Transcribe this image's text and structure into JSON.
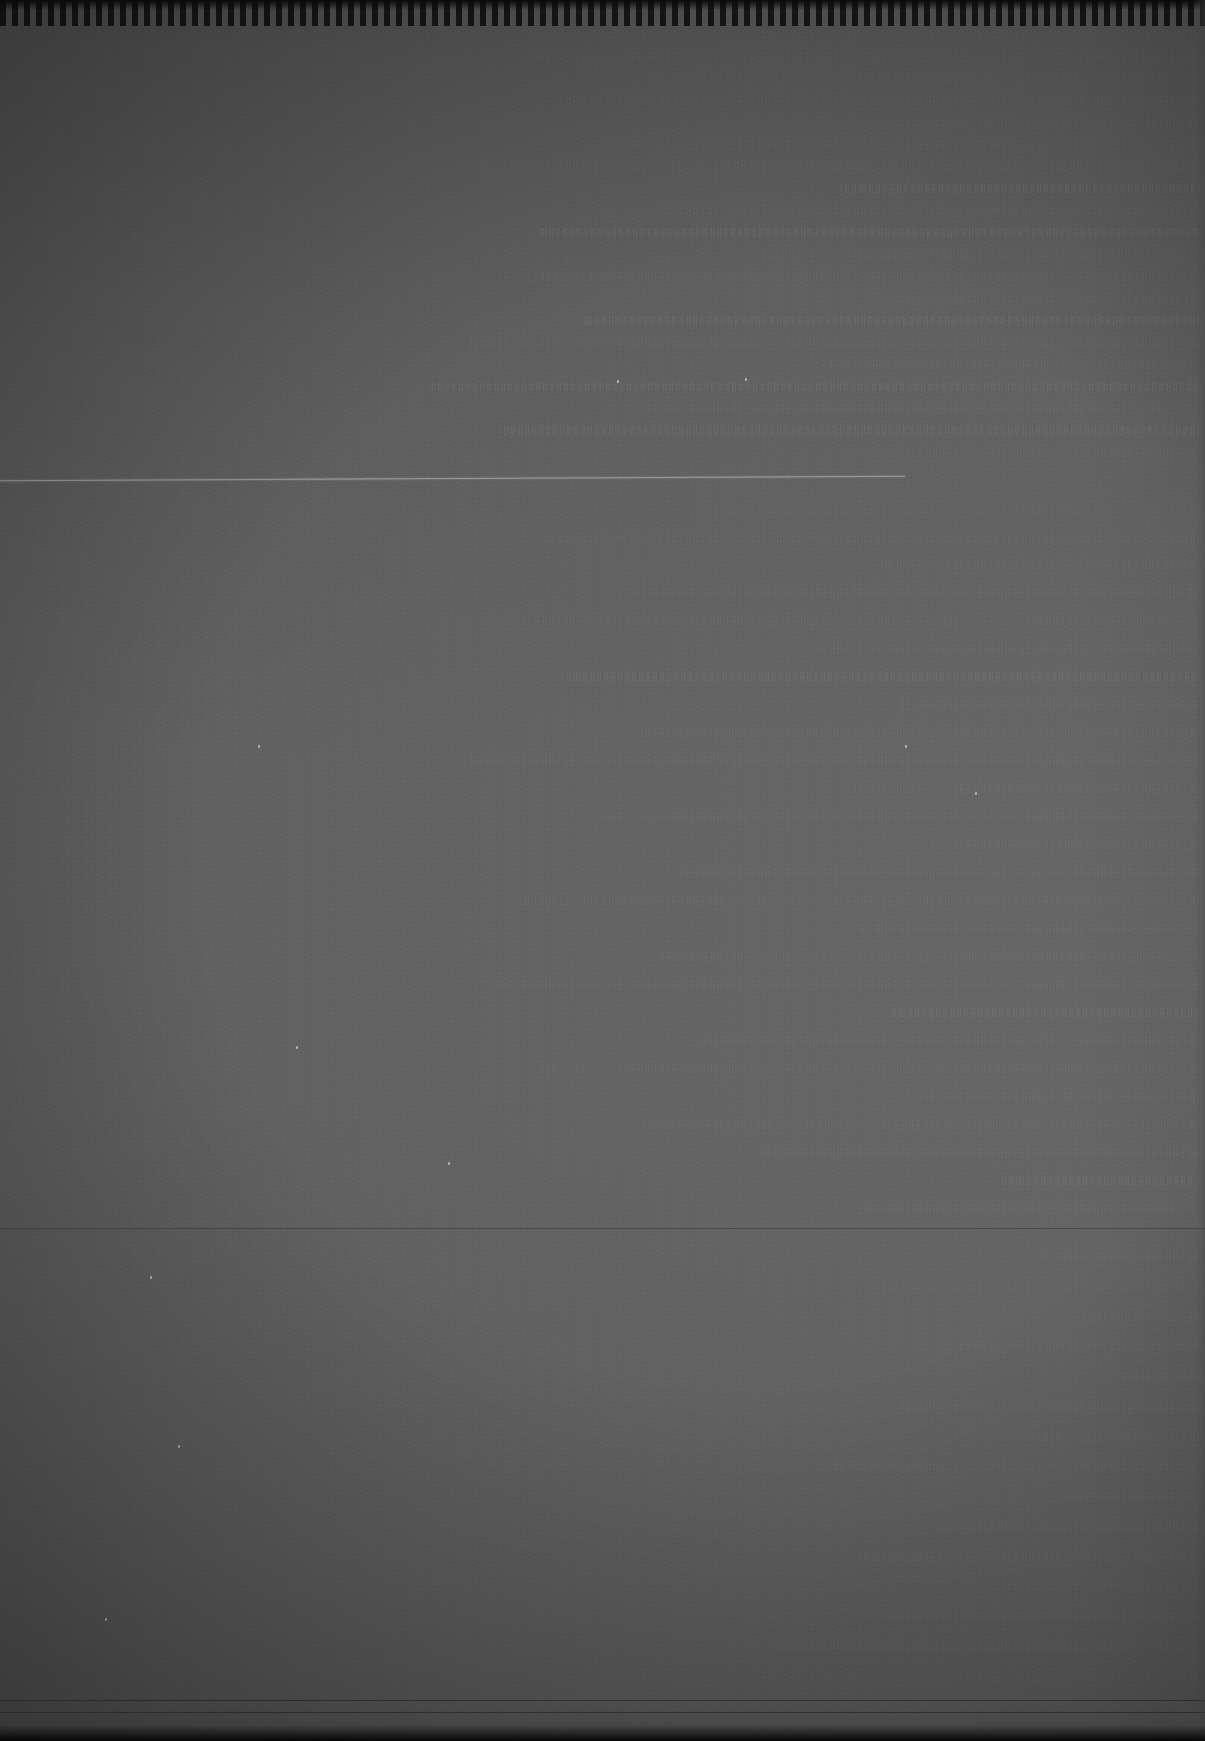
{
  "document": {
    "kind": "underexposed-scanned-page",
    "orientation": "portrait",
    "width_px": 1205,
    "height_px": 1741,
    "legibility_note": "No text is legible at any zoom level; the page is almost entirely black with faint line structure.",
    "alt_text": "A very dark, near-black photograph of a printed page. Faint horizontal rows of unreadable text are visible toward the right half, with a thin bright horizontal rule across the upper-middle area and fainter rules lower down."
  },
  "colors": {
    "page_background": "#242424",
    "darkest_area": "#141414",
    "lightest_area": "#2c2c2c",
    "rule_bright": "#9a9a9a",
    "rule_faint": "#4a4a4a",
    "edge_shadow": "#090909",
    "page_edge_highlight": "#484848"
  },
  "regions": {
    "top_edge": {
      "label": "wavy dark page edge",
      "y": 0,
      "height": 26
    },
    "left_margin": {
      "label": "blank left margin",
      "x": 0,
      "width": 400
    },
    "text_column": {
      "label": "faint unreadable text block",
      "x": 410,
      "width": 790
    },
    "right_page_edge": {
      "label": "lighter page edge strip",
      "x": 1193,
      "width": 12
    },
    "bottom_edge": {
      "label": "dark bottom page edge",
      "y": 1725,
      "height": 16
    }
  },
  "rules": [
    {
      "name": "primary-separator-rule",
      "x": 0,
      "y": 478,
      "width": 905,
      "weight": "bright"
    },
    {
      "name": "secondary-separator-rule",
      "x": 0,
      "y": 1228,
      "width": 1205,
      "weight": "faint"
    },
    {
      "name": "lower-separator-rule",
      "x": 0,
      "y": 1700,
      "width": 1205,
      "weight": "very-faint"
    },
    {
      "name": "lower-separator-rule-2",
      "x": 0,
      "y": 1712,
      "width": 1205,
      "weight": "very-faint"
    }
  ],
  "text_lines": [
    {
      "x": 600,
      "y": 30,
      "w": 600,
      "o": "dimmer"
    },
    {
      "x": 520,
      "y": 52,
      "w": 680,
      "o": "dim"
    },
    {
      "x": 700,
      "y": 74,
      "w": 500,
      "o": "dim"
    },
    {
      "x": 560,
      "y": 96,
      "w": 640,
      "o": "dim"
    },
    {
      "x": 880,
      "y": 118,
      "w": 320,
      "o": "dim"
    },
    {
      "x": 620,
      "y": 140,
      "w": 580,
      "o": "dim"
    },
    {
      "x": 480,
      "y": 162,
      "w": 720,
      "o": "dim"
    },
    {
      "x": 840,
      "y": 184,
      "w": 360,
      "o": "normal"
    },
    {
      "x": 660,
      "y": 206,
      "w": 540,
      "o": "dim"
    },
    {
      "x": 540,
      "y": 228,
      "w": 660,
      "o": "normal"
    },
    {
      "x": 760,
      "y": 250,
      "w": 440,
      "o": "dim"
    },
    {
      "x": 500,
      "y": 272,
      "w": 700,
      "o": "dim"
    },
    {
      "x": 900,
      "y": 294,
      "w": 300,
      "o": "dim"
    },
    {
      "x": 580,
      "y": 316,
      "w": 620,
      "o": "normal"
    },
    {
      "x": 470,
      "y": 338,
      "w": 730,
      "o": "dim"
    },
    {
      "x": 820,
      "y": 360,
      "w": 380,
      "o": "dim"
    },
    {
      "x": 430,
      "y": 382,
      "w": 770,
      "o": "normal"
    },
    {
      "x": 640,
      "y": 404,
      "w": 560,
      "o": "dim"
    },
    {
      "x": 500,
      "y": 426,
      "w": 700,
      "o": "normal"
    },
    {
      "x": 860,
      "y": 448,
      "w": 340,
      "o": "dim"
    },
    {
      "x": 700,
      "y": 506,
      "w": 500,
      "o": "dimmer"
    },
    {
      "x": 540,
      "y": 534,
      "w": 660,
      "o": "dim"
    },
    {
      "x": 880,
      "y": 560,
      "w": 320,
      "o": "dim"
    },
    {
      "x": 620,
      "y": 588,
      "w": 580,
      "o": "dim"
    },
    {
      "x": 480,
      "y": 616,
      "w": 720,
      "o": "dim"
    },
    {
      "x": 820,
      "y": 644,
      "w": 380,
      "o": "dim"
    },
    {
      "x": 560,
      "y": 672,
      "w": 640,
      "o": "normal"
    },
    {
      "x": 900,
      "y": 700,
      "w": 300,
      "o": "dim"
    },
    {
      "x": 640,
      "y": 728,
      "w": 560,
      "o": "dim"
    },
    {
      "x": 470,
      "y": 756,
      "w": 730,
      "o": "dim"
    },
    {
      "x": 840,
      "y": 784,
      "w": 360,
      "o": "dim"
    },
    {
      "x": 600,
      "y": 812,
      "w": 600,
      "o": "dim"
    },
    {
      "x": 930,
      "y": 840,
      "w": 270,
      "o": "dim"
    },
    {
      "x": 680,
      "y": 868,
      "w": 520,
      "o": "dim"
    },
    {
      "x": 520,
      "y": 896,
      "w": 680,
      "o": "dim"
    },
    {
      "x": 860,
      "y": 924,
      "w": 340,
      "o": "dim"
    },
    {
      "x": 660,
      "y": 952,
      "w": 540,
      "o": "dim"
    },
    {
      "x": 500,
      "y": 980,
      "w": 700,
      "o": "dim"
    },
    {
      "x": 890,
      "y": 1008,
      "w": 310,
      "o": "normal"
    },
    {
      "x": 700,
      "y": 1036,
      "w": 500,
      "o": "dim"
    },
    {
      "x": 540,
      "y": 1064,
      "w": 660,
      "o": "dim"
    },
    {
      "x": 920,
      "y": 1092,
      "w": 280,
      "o": "dim"
    },
    {
      "x": 640,
      "y": 1120,
      "w": 560,
      "o": "dim"
    },
    {
      "x": 760,
      "y": 1148,
      "w": 440,
      "o": "dim"
    },
    {
      "x": 1000,
      "y": 1176,
      "w": 200,
      "o": "normal"
    },
    {
      "x": 860,
      "y": 1204,
      "w": 340,
      "o": "dim"
    },
    {
      "x": 1040,
      "y": 1252,
      "w": 160,
      "o": "dim"
    },
    {
      "x": 880,
      "y": 1282,
      "w": 320,
      "o": "dimmer"
    },
    {
      "x": 1080,
      "y": 1312,
      "w": 120,
      "o": "dim"
    },
    {
      "x": 960,
      "y": 1342,
      "w": 240,
      "o": "dim"
    },
    {
      "x": 1120,
      "y": 1372,
      "w": 80,
      "o": "dim"
    },
    {
      "x": 900,
      "y": 1402,
      "w": 300,
      "o": "dim"
    },
    {
      "x": 1020,
      "y": 1432,
      "w": 180,
      "o": "dim"
    },
    {
      "x": 820,
      "y": 1462,
      "w": 380,
      "o": "dim"
    },
    {
      "x": 1060,
      "y": 1492,
      "w": 140,
      "o": "dim"
    },
    {
      "x": 940,
      "y": 1522,
      "w": 260,
      "o": "dim"
    },
    {
      "x": 860,
      "y": 1552,
      "w": 340,
      "o": "dim"
    },
    {
      "x": 1000,
      "y": 1582,
      "w": 200,
      "o": "dim"
    },
    {
      "x": 880,
      "y": 1612,
      "w": 320,
      "o": "dim"
    },
    {
      "x": 780,
      "y": 1642,
      "w": 420,
      "o": "dim"
    },
    {
      "x": 600,
      "y": 1672,
      "w": 600,
      "o": "dimmer"
    }
  ],
  "specks": [
    {
      "x": 745,
      "y": 378
    },
    {
      "x": 617,
      "y": 380
    },
    {
      "x": 975,
      "y": 792
    },
    {
      "x": 905,
      "y": 745
    },
    {
      "x": 296,
      "y": 1046
    },
    {
      "x": 150,
      "y": 1276
    },
    {
      "x": 178,
      "y": 1445
    },
    {
      "x": 105,
      "y": 1618
    },
    {
      "x": 448,
      "y": 1162
    },
    {
      "x": 258,
      "y": 745
    }
  ]
}
